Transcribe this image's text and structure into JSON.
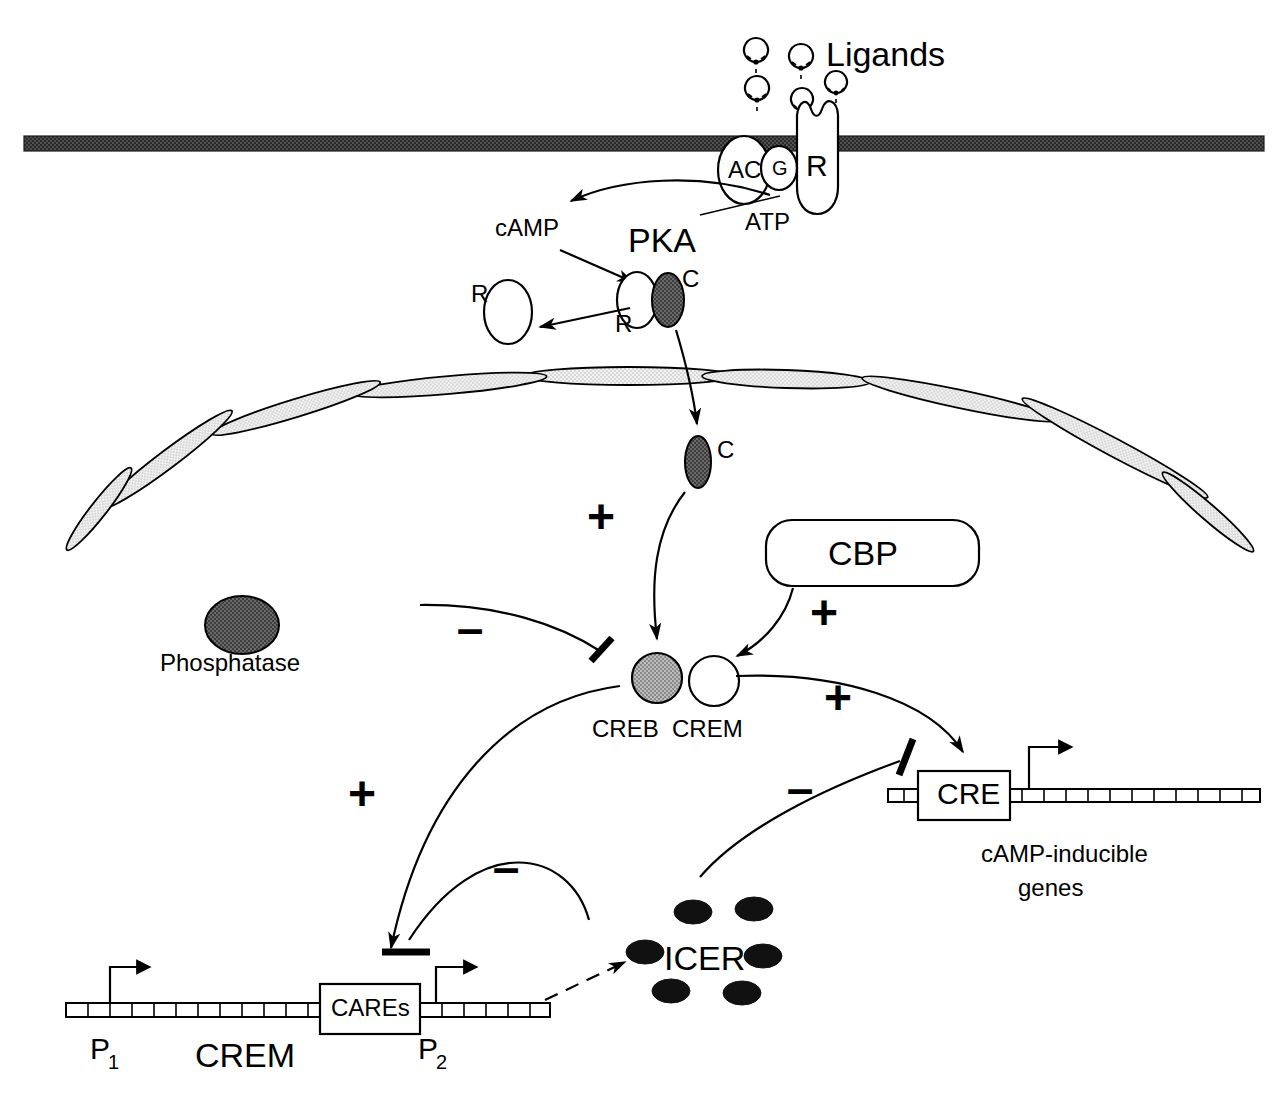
{
  "diagram": {
    "colors": {
      "ink": "#000000",
      "background": "#ffffff",
      "membrane": "#4a4a4a",
      "dark_protein": "#5e5e5e",
      "mid_protein": "#9b9b9b",
      "icer_dot": "#111111"
    }
  },
  "extracellular": {
    "ligands_label": "Ligands",
    "ligand_count": 5
  },
  "membrane": {
    "name": "plasma-membrane",
    "receptor_label": "R",
    "g_protein_label": "G",
    "adenylyl_cyclase_label": "AC",
    "substrate_label": "ATP"
  },
  "cytoplasm": {
    "camp_label": "cAMP",
    "pka_label": "PKA",
    "pka_regulatory_label": "R",
    "pka_catalytic_label": "C",
    "free_regulatory_label": "R"
  },
  "nucleus": {
    "catalytic_label": "C",
    "cbp_label": "CBP",
    "phosphatase_label": "Phosphatase",
    "creb_label": "CREB",
    "crem_label": "CREM",
    "icer_label": "ICER",
    "icer_dot_count": 6
  },
  "genes": {
    "cre_box_label": "CRE",
    "cre_gene_caption_line1": "cAMP-inducible",
    "cre_gene_caption_line2": "genes",
    "cares_box_label": "CAREs",
    "crem_gene_label": "CREM",
    "promoter_1_label": "P",
    "promoter_1_sub": "1",
    "promoter_2_label": "P",
    "promoter_2_sub": "2"
  },
  "signs": {
    "plus": "+",
    "minus": "–",
    "plus_c_to_creb": "+",
    "minus_phosphatase": "–",
    "plus_cbp_to_creb": "+",
    "plus_creb_to_cre": "+",
    "minus_crem_to_cre": "–",
    "plus_creb_to_cares": "+",
    "minus_icer_to_cares": "–"
  }
}
